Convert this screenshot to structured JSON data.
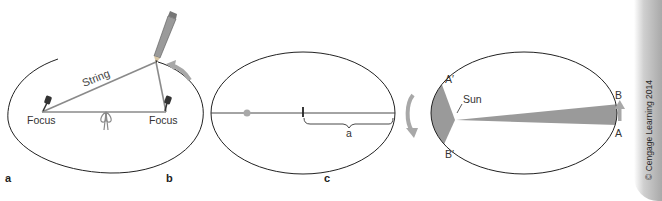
{
  "figure": {
    "credit": "© Cengage Learning 2014",
    "colors": {
      "line": "#222222",
      "string": "#8a8a8a",
      "shade": "#9a9a9a",
      "arrow": "#a8a8a8",
      "background": "#ffffff"
    }
  },
  "panels": [
    {
      "id": "a",
      "label": "a",
      "annotations": {
        "string_label": "String",
        "focus_left": "Focus",
        "focus_right": "Focus"
      }
    },
    {
      "id": "b",
      "label": "b",
      "annotations": {
        "semi_major_axis": "a"
      }
    },
    {
      "id": "c",
      "label": "c",
      "annotations": {
        "sun": "Sun",
        "a_prime": "A′",
        "b_prime": "B′",
        "a": "A",
        "b": "B"
      }
    }
  ]
}
